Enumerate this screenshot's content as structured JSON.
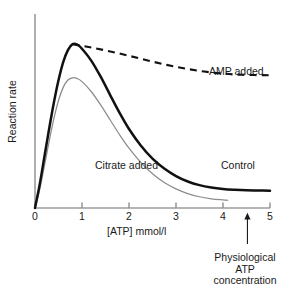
{
  "chart_data": {
    "type": "line",
    "title": "",
    "xlabel": "[ATP] mmol/l",
    "ylabel": "Reaction rate",
    "xlim": [
      0,
      5
    ],
    "ylim": [
      0,
      1
    ],
    "xticks": [
      "0",
      "1",
      "2",
      "3",
      "4",
      "5"
    ],
    "yticks": [],
    "grid": false,
    "legend_position": "inline-annotations",
    "series": [
      {
        "name": "Control",
        "style": "solid-thick",
        "color": "#111111",
        "label_x": 4.0,
        "label_y": 0.28,
        "points": [
          [
            0.0,
            0.0
          ],
          [
            0.1,
            0.14
          ],
          [
            0.2,
            0.305
          ],
          [
            0.3,
            0.47
          ],
          [
            0.4,
            0.625
          ],
          [
            0.5,
            0.76
          ],
          [
            0.6,
            0.868
          ],
          [
            0.7,
            0.94
          ],
          [
            0.8,
            0.975
          ],
          [
            0.9,
            0.972
          ],
          [
            1.0,
            0.948
          ],
          [
            1.2,
            0.876
          ],
          [
            1.4,
            0.78
          ],
          [
            1.6,
            0.672
          ],
          [
            1.8,
            0.566
          ],
          [
            2.0,
            0.47
          ],
          [
            2.25,
            0.372
          ],
          [
            2.5,
            0.294
          ],
          [
            2.75,
            0.235
          ],
          [
            3.0,
            0.19
          ],
          [
            3.25,
            0.158
          ],
          [
            3.5,
            0.136
          ],
          [
            3.75,
            0.122
          ],
          [
            4.0,
            0.113
          ],
          [
            4.25,
            0.108
          ],
          [
            4.5,
            0.105
          ],
          [
            4.75,
            0.104
          ],
          [
            5.0,
            0.103
          ]
        ]
      },
      {
        "name": "AMP added",
        "style": "dashed",
        "color": "#111111",
        "label_x": 3.73,
        "label_y": 0.72,
        "points": [
          [
            0.8,
            0.975
          ],
          [
            1.2,
            0.955
          ],
          [
            1.6,
            0.932
          ],
          [
            2.0,
            0.906
          ],
          [
            2.4,
            0.878
          ],
          [
            2.8,
            0.852
          ],
          [
            3.2,
            0.83
          ],
          [
            3.6,
            0.812
          ],
          [
            4.0,
            0.8
          ],
          [
            4.4,
            0.793
          ],
          [
            5.0,
            0.79
          ]
        ]
      },
      {
        "name": "Citrate added",
        "style": "solid-thin",
        "color": "#8c8c8c",
        "label_x": 1.32,
        "label_y": 0.28,
        "points": [
          [
            0.0,
            0.0
          ],
          [
            0.1,
            0.11
          ],
          [
            0.2,
            0.25
          ],
          [
            0.3,
            0.395
          ],
          [
            0.4,
            0.53
          ],
          [
            0.5,
            0.64
          ],
          [
            0.6,
            0.718
          ],
          [
            0.7,
            0.762
          ],
          [
            0.8,
            0.775
          ],
          [
            0.9,
            0.77
          ],
          [
            1.0,
            0.752
          ],
          [
            1.2,
            0.692
          ],
          [
            1.4,
            0.612
          ],
          [
            1.6,
            0.524
          ],
          [
            1.8,
            0.436
          ],
          [
            2.0,
            0.356
          ],
          [
            2.25,
            0.272
          ],
          [
            2.5,
            0.204
          ],
          [
            2.75,
            0.152
          ],
          [
            3.0,
            0.114
          ],
          [
            3.25,
            0.086
          ],
          [
            3.5,
            0.067
          ],
          [
            3.75,
            0.055
          ],
          [
            4.0,
            0.048
          ],
          [
            4.1,
            0.046
          ]
        ]
      }
    ],
    "annotations": [
      {
        "name": "physiological-atp-concentration",
        "text": "Physiological ATP concentration",
        "text_lines": [
          "Physiological",
          "ATP",
          "concentration"
        ],
        "arrow_x": 4.52,
        "arrow_from_y": -0.215,
        "arrow_to_y": -0.055
      }
    ]
  },
  "axes": {
    "x_label": "[ATP] mmol/l",
    "y_label": "Reaction rate",
    "x_tick_labels": [
      "0",
      "1",
      "2",
      "3",
      "4",
      "5"
    ]
  },
  "series_labels": {
    "amp": "AMP added",
    "citrate": "Citrate added",
    "control": "Control"
  },
  "annotation": {
    "line1": "Physiological",
    "line2": "ATP",
    "line3": "concentration"
  },
  "colors": {
    "background": "#ffffff",
    "axis": "#9b9b9b",
    "control_curve": "#111111",
    "citrate_curve": "#8c8c8c",
    "amp_curve": "#111111",
    "text": "#1a1a1a"
  }
}
